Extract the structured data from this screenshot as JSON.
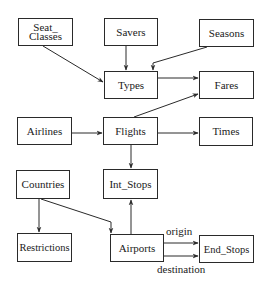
{
  "diagram": {
    "type": "entity-relationship schema",
    "nodes": [
      {
        "id": "seat_classes",
        "label": "Seat_ Classes",
        "x": 18,
        "y": 18,
        "w": 55,
        "h": 28
      },
      {
        "id": "savers",
        "label": "Savers",
        "x": 104,
        "y": 18,
        "w": 54,
        "h": 28
      },
      {
        "id": "seasons",
        "label": "Seasons",
        "x": 199,
        "y": 19,
        "w": 55,
        "h": 28
      },
      {
        "id": "types",
        "label": "Types",
        "x": 104,
        "y": 71,
        "w": 54,
        "h": 28
      },
      {
        "id": "fares",
        "label": "Fares",
        "x": 199,
        "y": 71,
        "w": 55,
        "h": 28
      },
      {
        "id": "airlines",
        "label": "Airlines",
        "x": 17,
        "y": 117,
        "w": 55,
        "h": 28
      },
      {
        "id": "flights",
        "label": "Flights",
        "x": 103,
        "y": 117,
        "w": 55,
        "h": 28
      },
      {
        "id": "times",
        "label": "Times",
        "x": 199,
        "y": 117,
        "w": 54,
        "h": 29
      },
      {
        "id": "countries",
        "label": "Countries",
        "x": 16,
        "y": 170,
        "w": 54,
        "h": 29
      },
      {
        "id": "int_stops",
        "label": "Int_Stops",
        "x": 103,
        "y": 169,
        "w": 55,
        "h": 30
      },
      {
        "id": "restrictions",
        "label": "Restrictions",
        "x": 17,
        "y": 233,
        "w": 55,
        "h": 29
      },
      {
        "id": "airports",
        "label": "Airports",
        "x": 110,
        "y": 234,
        "w": 54,
        "h": 28
      },
      {
        "id": "end_stops",
        "label": "End_Stops",
        "x": 199,
        "y": 235,
        "w": 55,
        "h": 28
      }
    ],
    "edges": [
      {
        "from": "seat_classes",
        "to": "types",
        "label": ""
      },
      {
        "from": "savers",
        "to": "types",
        "label": ""
      },
      {
        "from": "seasons",
        "to": "types",
        "label": ""
      },
      {
        "from": "types",
        "to": "fares",
        "label": ""
      },
      {
        "from": "flights",
        "to": "fares",
        "label": ""
      },
      {
        "from": "airlines",
        "to": "flights",
        "label": ""
      },
      {
        "from": "flights",
        "to": "times",
        "label": ""
      },
      {
        "from": "flights",
        "to": "int_stops",
        "label": ""
      },
      {
        "from": "airports",
        "to": "int_stops",
        "label": ""
      },
      {
        "from": "countries",
        "to": "restrictions",
        "label": ""
      },
      {
        "from": "countries",
        "to": "airports",
        "label": ""
      },
      {
        "from": "airports",
        "to": "end_stops",
        "label": "origin"
      },
      {
        "from": "airports",
        "to": "end_stops",
        "label": "destination"
      }
    ],
    "edge_labels": {
      "origin": "origin",
      "destination": "destination"
    }
  }
}
